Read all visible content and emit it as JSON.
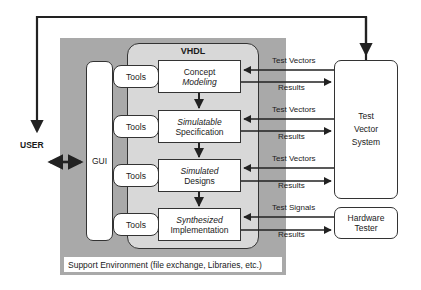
{
  "diagram": {
    "user": {
      "label": "USER"
    },
    "gui": {
      "label": "GUI"
    },
    "vhdl": {
      "title": "VHDL"
    },
    "tools": [
      {
        "label": "Tools"
      },
      {
        "label": "Tools"
      },
      {
        "label": "Tools"
      },
      {
        "label": "Tools"
      }
    ],
    "stages": [
      {
        "line1": "Concept",
        "line1_italic": false,
        "line2": "Modeling",
        "line2_italic": true
      },
      {
        "line1": "Simulatable",
        "line1_italic": true,
        "line2": "Specification",
        "line2_italic": false
      },
      {
        "line1": "Simulated",
        "line1_italic": true,
        "line2": "Designs",
        "line2_italic": false
      },
      {
        "line1": "Synthesized",
        "line1_italic": true,
        "line2": "Implementation",
        "line2_italic": false
      }
    ],
    "test_vector_system": {
      "line1": "Test",
      "line2": "Vector",
      "line3": "System"
    },
    "hardware_tester": {
      "line1": "Hardware",
      "line2": "Tester"
    },
    "flows": [
      {
        "in_label": "Test Vectors",
        "out_label": "Results"
      },
      {
        "in_label": "Test Vectors",
        "out_label": "Results"
      },
      {
        "in_label": "Test Vectors",
        "out_label": "Results"
      },
      {
        "in_label": "Test Signals",
        "out_label": "Results"
      }
    ],
    "support_environment": {
      "label": "Support Environment (file exchange, Libraries, etc.)"
    },
    "colors": {
      "outer_gray": "#a9a9a9",
      "vhdl_gray": "#d8d8d8",
      "line": "#222222",
      "box_fill": "#ffffff"
    }
  }
}
